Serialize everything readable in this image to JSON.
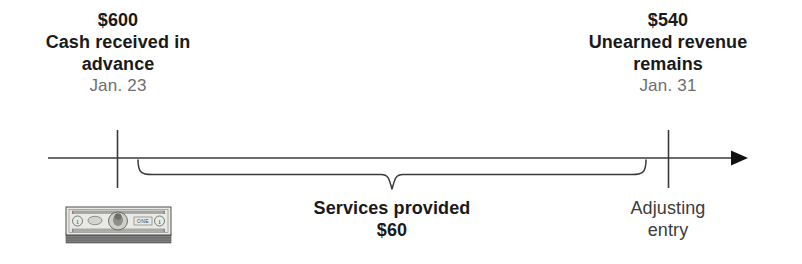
{
  "diagram": {
    "title_present": false,
    "type": "accounting-timeline",
    "axis": {
      "arrow_direction": "right",
      "line_color": "#3a3a3a"
    },
    "events": [
      {
        "id": "cash-received",
        "amount": "$600",
        "description_line1": "Cash received in",
        "description_line2": "advance",
        "date": "Jan. 23",
        "icon": "money-stack-icon"
      },
      {
        "id": "unearned-remains",
        "amount": "$540",
        "description_line1": "Unearned revenue",
        "description_line2": "remains",
        "date": "Jan. 31",
        "sub_label_line1": "Adjusting",
        "sub_label_line2": "entry"
      }
    ],
    "span": {
      "id": "services-span",
      "label": "Services provided",
      "amount": "$60",
      "brace_direction": "down"
    },
    "colors": {
      "text_primary": "#1a1a1a",
      "text_muted": "#6e6e6e",
      "text_sub": "#3c3c3c",
      "line": "#3a3a3a"
    }
  }
}
